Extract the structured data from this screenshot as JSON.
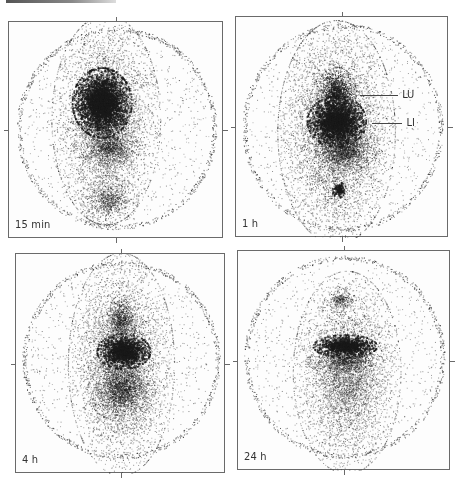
{
  "figure": {
    "panels": [
      {
        "id": "p15min",
        "label": "15 min",
        "box": {
          "x": 8,
          "y": 21,
          "w": 215,
          "h": 217
        },
        "outline": {
          "cx": 0.5,
          "cy": 0.49,
          "rx": 0.455,
          "ry": 0.455
        },
        "blobs": [
          {
            "cx": 0.45,
            "cy": 0.45,
            "rx": 0.22,
            "ry": 0.42,
            "density": 0.3
          },
          {
            "cx": 0.43,
            "cy": 0.37,
            "rx": 0.12,
            "ry": 0.14,
            "density": 0.95
          },
          {
            "cx": 0.47,
            "cy": 0.58,
            "rx": 0.12,
            "ry": 0.08,
            "density": 0.45
          },
          {
            "cx": 0.46,
            "cy": 0.82,
            "rx": 0.12,
            "ry": 0.1,
            "density": 0.35
          }
        ]
      },
      {
        "id": "p1h",
        "label": "1 h",
        "box": {
          "x": 235,
          "y": 16,
          "w": 213,
          "h": 221
        },
        "outline": {
          "cx": 0.5,
          "cy": 0.5,
          "rx": 0.46,
          "ry": 0.46
        },
        "blobs": [
          {
            "cx": 0.47,
            "cy": 0.52,
            "rx": 0.24,
            "ry": 0.44,
            "density": 0.32
          },
          {
            "cx": 0.47,
            "cy": 0.34,
            "rx": 0.08,
            "ry": 0.1,
            "density": 0.8
          },
          {
            "cx": 0.47,
            "cy": 0.47,
            "rx": 0.12,
            "ry": 0.1,
            "density": 0.95
          },
          {
            "cx": 0.52,
            "cy": 0.6,
            "rx": 0.12,
            "ry": 0.08,
            "density": 0.55
          },
          {
            "cx": 0.48,
            "cy": 0.78,
            "rx": 0.03,
            "ry": 0.03,
            "density": 0.9
          }
        ],
        "annotations": [
          {
            "text": "LU",
            "x": 0.78,
            "y": 0.32,
            "line_from_x": 0.58,
            "line_to_x": 0.76
          },
          {
            "text": "LI",
            "x": 0.8,
            "y": 0.45,
            "line_from_x": 0.64,
            "line_to_x": 0.78
          }
        ]
      },
      {
        "id": "p4h",
        "label": "4 h",
        "box": {
          "x": 15,
          "y": 253,
          "w": 210,
          "h": 220
        },
        "outline": {
          "cx": 0.5,
          "cy": 0.48,
          "rx": 0.46,
          "ry": 0.44
        },
        "blobs": [
          {
            "cx": 0.5,
            "cy": 0.5,
            "rx": 0.22,
            "ry": 0.44,
            "density": 0.3
          },
          {
            "cx": 0.5,
            "cy": 0.3,
            "rx": 0.06,
            "ry": 0.1,
            "density": 0.55
          },
          {
            "cx": 0.51,
            "cy": 0.44,
            "rx": 0.11,
            "ry": 0.07,
            "density": 0.95
          },
          {
            "cx": 0.5,
            "cy": 0.62,
            "rx": 0.14,
            "ry": 0.12,
            "density": 0.45
          }
        ]
      },
      {
        "id": "p24h",
        "label": "24 h",
        "box": {
          "x": 237,
          "y": 250,
          "w": 213,
          "h": 220
        },
        "outline": {
          "cx": 0.5,
          "cy": 0.48,
          "rx": 0.46,
          "ry": 0.45
        },
        "blobs": [
          {
            "cx": 0.51,
            "cy": 0.55,
            "rx": 0.22,
            "ry": 0.4,
            "density": 0.28
          },
          {
            "cx": 0.48,
            "cy": 0.22,
            "rx": 0.06,
            "ry": 0.05,
            "density": 0.45
          },
          {
            "cx": 0.5,
            "cy": 0.43,
            "rx": 0.13,
            "ry": 0.045,
            "density": 0.98
          },
          {
            "cx": 0.5,
            "cy": 0.5,
            "rx": 0.16,
            "ry": 0.05,
            "density": 0.45
          }
        ]
      }
    ],
    "colors": {
      "dot": "#1a1a1a",
      "frame": "#6a6a6a",
      "background": "#ffffff"
    }
  }
}
